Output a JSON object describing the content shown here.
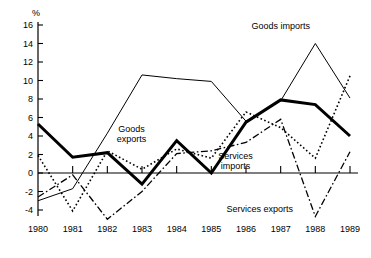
{
  "chart_data": {
    "type": "line",
    "title": "",
    "xlabel": "",
    "ylabel": "%",
    "ylim": [
      -6,
      17
    ],
    "xlim": [
      1980,
      1989
    ],
    "grid": false,
    "legend_position": "inline-annotations",
    "yticks": [
      16,
      14,
      12,
      10,
      8,
      6,
      4,
      2,
      0,
      -2,
      -4
    ],
    "ytick_labels": [
      "16",
      "14",
      "12",
      "10",
      "8",
      "6",
      "4",
      "2",
      "0",
      "-2",
      "-4"
    ],
    "x": [
      1980,
      1981,
      1982,
      1983,
      1984,
      1985,
      1986,
      1987,
      1988,
      1989
    ],
    "xtick_labels": [
      "1980",
      "1981",
      "1982",
      "1983",
      "1984",
      "1985",
      "1986",
      "1987",
      "1988",
      "1989"
    ],
    "series": [
      {
        "name": "Goods imports",
        "style": "thin-solid",
        "color": "#000000",
        "values": [
          -3.0,
          -1.7,
          4.3,
          10.6,
          10.2,
          9.9,
          5.6,
          7.8,
          14.0,
          8.1
        ]
      },
      {
        "name": "Goods exports",
        "style": "dotted",
        "color": "#000000",
        "values": [
          1.9,
          -4.1,
          2.4,
          0.4,
          2.6,
          1.6,
          6.6,
          4.9,
          1.6,
          10.5
        ]
      },
      {
        "name": "Services imports",
        "style": "thick-solid",
        "color": "#000000",
        "values": [
          5.3,
          1.7,
          2.2,
          -1.2,
          3.5,
          0.0,
          5.5,
          7.9,
          7.4,
          4.0
        ]
      },
      {
        "name": "Services exports",
        "style": "dash-dot",
        "color": "#000000",
        "values": [
          -2.6,
          -0.2,
          -5.0,
          -2.0,
          2.1,
          2.4,
          3.3,
          5.8,
          -4.7,
          2.3
        ]
      }
    ],
    "annotations": [
      {
        "text": "Goods imports",
        "x": 1987.0,
        "y": 15.6
      },
      {
        "text": "Goods exports",
        "x": 1982.7,
        "y": 4.4
      },
      {
        "text": "Services imports",
        "x": 1985.7,
        "y": 1.5
      },
      {
        "text": "Services exports",
        "x": 1986.4,
        "y": -4.2
      }
    ]
  },
  "axis": {
    "y_unit_label": "%"
  }
}
